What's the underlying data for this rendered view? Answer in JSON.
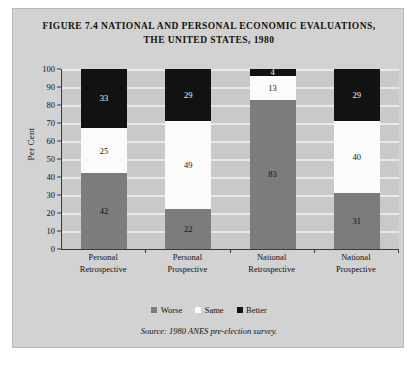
{
  "figure": {
    "title_line1": "FIGURE 7.4 NATIONAL AND PERSONAL ECONOMIC EVALUATIONS,",
    "title_line2": "THE UNITED STATES, 1980",
    "source_note": "Source: 1980 ANES pre-election survey."
  },
  "chart_data": {
    "type": "bar",
    "stacked": true,
    "title": "FIGURE 7.4 NATIONAL AND PERSONAL ECONOMIC EVALUATIONS, THE UNITED STATES, 1980",
    "xlabel": "",
    "ylabel": "Per Cent",
    "ylim": [
      0,
      100
    ],
    "yticks": [
      0,
      10,
      20,
      30,
      40,
      50,
      60,
      70,
      80,
      90,
      100
    ],
    "grid": true,
    "legend_position": "bottom",
    "categories": [
      "Personal Retrospective",
      "Personal Prospective",
      "National Retrospective",
      "National Prospective"
    ],
    "category_lines": [
      [
        "Personal",
        "Retrospective"
      ],
      [
        "Personal",
        "Prospective"
      ],
      [
        "National",
        "Retrospective"
      ],
      [
        "National",
        "Prospective"
      ]
    ],
    "series": [
      {
        "name": "Worse",
        "color": "#7c7c7c",
        "values": [
          42,
          22,
          83,
          31
        ]
      },
      {
        "name": "Same",
        "color": "#fbfbfa",
        "values": [
          25,
          49,
          13,
          40
        ]
      },
      {
        "name": "Better",
        "color": "#121212",
        "values": [
          33,
          29,
          4,
          29
        ]
      }
    ]
  },
  "legend": {
    "items": [
      {
        "label": "Worse",
        "swatch": "sw-worse"
      },
      {
        "label": "Same",
        "swatch": "sw-same"
      },
      {
        "label": "Better",
        "swatch": "sw-better"
      }
    ]
  }
}
